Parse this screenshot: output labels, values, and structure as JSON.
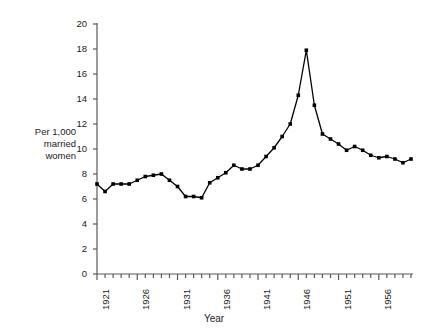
{
  "chart_data": {
    "type": "line",
    "title": "",
    "xlabel": "Year",
    "ylabel": "Per 1,000 married women",
    "ylabel_lines": [
      "Per 1,000",
      "married",
      "women"
    ],
    "ylim": [
      0,
      20
    ],
    "yticks": [
      0,
      2,
      4,
      6,
      8,
      10,
      12,
      14,
      16,
      18,
      20
    ],
    "ytick_labels": [
      "0",
      "2",
      "4",
      "6",
      "8",
      "10",
      "12",
      "14",
      "16",
      "18",
      "20"
    ],
    "xlim": [
      1921,
      1960
    ],
    "xticks": [
      1921,
      1926,
      1931,
      1936,
      1941,
      1946,
      1951,
      1956
    ],
    "xtick_labels": [
      "1921",
      "1926",
      "1931",
      "1936",
      "1941",
      "1946",
      "1951",
      "1956"
    ],
    "xtick_minor_step": 1,
    "grid": false,
    "legend": "none",
    "marker": "square",
    "line_color": "#000000",
    "marker_color": "#000000",
    "axis_color": "#595959",
    "background": "#ffffff",
    "x": [
      1921,
      1922,
      1923,
      1924,
      1925,
      1926,
      1927,
      1928,
      1929,
      1930,
      1931,
      1932,
      1933,
      1934,
      1935,
      1936,
      1937,
      1938,
      1939,
      1940,
      1941,
      1942,
      1943,
      1944,
      1945,
      1946,
      1947,
      1948,
      1949,
      1950,
      1951,
      1952,
      1953,
      1954,
      1955,
      1956,
      1957,
      1958,
      1959,
      1960
    ],
    "values": [
      7.2,
      6.6,
      7.2,
      7.2,
      7.2,
      7.5,
      7.8,
      7.9,
      8.0,
      7.5,
      7.0,
      6.2,
      6.2,
      6.1,
      7.3,
      7.7,
      8.1,
      8.7,
      8.4,
      8.4,
      8.7,
      9.4,
      10.1,
      11.0,
      12.0,
      14.3,
      17.9,
      13.5,
      11.2,
      10.8,
      10.4,
      9.9,
      10.2,
      9.9,
      9.5,
      9.3,
      9.4,
      9.2,
      8.9,
      9.2
    ],
    "series": [
      {
        "name": "Divorces per 1,000 married women",
        "values": [
          7.2,
          6.6,
          7.2,
          7.2,
          7.2,
          7.5,
          7.8,
          7.9,
          8.0,
          7.5,
          7.0,
          6.2,
          6.2,
          6.1,
          7.3,
          7.7,
          8.1,
          8.7,
          8.4,
          8.4,
          8.7,
          9.4,
          10.1,
          11.0,
          12.0,
          14.3,
          17.9,
          13.5,
          11.2,
          10.8,
          10.4,
          9.9,
          10.2,
          9.9,
          9.5,
          9.3,
          9.4,
          9.2,
          8.9,
          9.2
        ]
      }
    ],
    "annotations": [],
    "peak": {
      "x": 1947,
      "y": 17.9
    }
  }
}
